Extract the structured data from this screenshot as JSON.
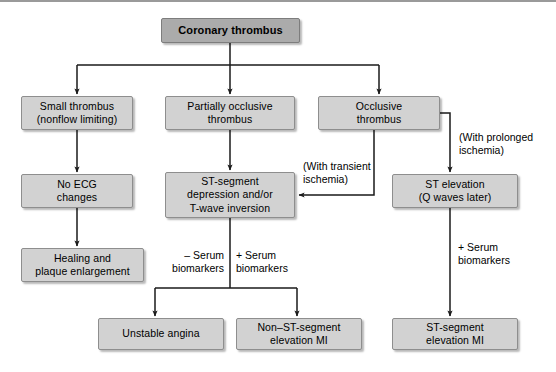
{
  "diagram": {
    "type": "flowchart",
    "colors": {
      "node_fill": "#d2d2d2",
      "root_fill": "#ababab",
      "node_border": "#8e8e8e",
      "edge": "#1a1a1a",
      "text": "#000000",
      "background": "#ffffff"
    },
    "nodes": [
      {
        "id": "root",
        "label": "Coronary thrombus"
      },
      {
        "id": "small",
        "label": "Small thrombus\n(nonflow limiting)"
      },
      {
        "id": "partial",
        "label": "Partially occlusive\nthrombus"
      },
      {
        "id": "occlusive",
        "label": "Occlusive\nthrombus"
      },
      {
        "id": "noecg",
        "label": "No ECG\nchanges"
      },
      {
        "id": "stdep",
        "label": "ST-segment\ndepression and/or\nT-wave inversion"
      },
      {
        "id": "stelev",
        "label": "ST elevation\n(Q waves later)"
      },
      {
        "id": "healing",
        "label": "Healing and\nplaque enlargement"
      },
      {
        "id": "unstable",
        "label": "Unstable angina"
      },
      {
        "id": "nstemi",
        "label": "Non–ST-segment\nelevation MI"
      },
      {
        "id": "stemi",
        "label": "ST-segment\nelevation MI"
      }
    ],
    "edge_labels": [
      {
        "id": "prolonged",
        "text": "(With prolonged\nischemia)"
      },
      {
        "id": "transient",
        "text": "(With transient\nischemia)"
      },
      {
        "id": "neg_serum",
        "text": "– Serum\nbiomarkers"
      },
      {
        "id": "pos_serum",
        "text": "+ Serum\nbiomarkers"
      },
      {
        "id": "pos_serum2",
        "text": "+ Serum\nbiomarkers"
      }
    ],
    "edges": [
      {
        "from": "root",
        "to": "small"
      },
      {
        "from": "root",
        "to": "partial"
      },
      {
        "from": "root",
        "to": "occlusive"
      },
      {
        "from": "small",
        "to": "noecg"
      },
      {
        "from": "partial",
        "to": "stdep"
      },
      {
        "from": "occlusive",
        "to": "stelev",
        "label": "prolonged"
      },
      {
        "from": "occlusive",
        "to": "stdep",
        "label": "transient"
      },
      {
        "from": "noecg",
        "to": "healing"
      },
      {
        "from": "stdep",
        "to": "unstable",
        "label": "neg_serum"
      },
      {
        "from": "stdep",
        "to": "nstemi",
        "label": "pos_serum"
      },
      {
        "from": "stelev",
        "to": "stemi",
        "label": "pos_serum2"
      }
    ]
  }
}
